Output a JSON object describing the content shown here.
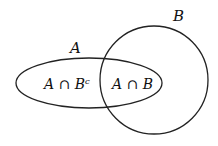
{
  "diagram": {
    "type": "venn",
    "sets": [
      {
        "name": "A",
        "label": "A",
        "shape": "ellipse"
      },
      {
        "name": "B",
        "label": "B",
        "shape": "circle"
      }
    ],
    "regions": [
      {
        "name": "a-minus-b",
        "label": "A ∩ Bᶜ"
      },
      {
        "name": "a-and-b",
        "label": "A ∩ B"
      }
    ],
    "stroke_color": "#222222"
  }
}
